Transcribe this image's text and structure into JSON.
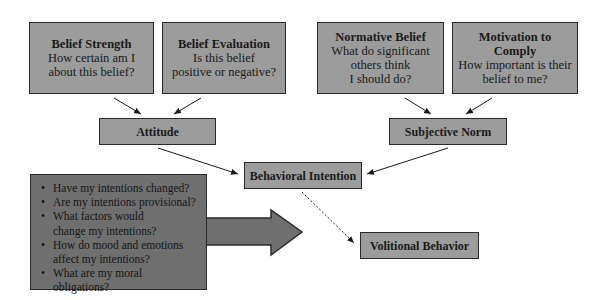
{
  "diagram": {
    "belief_strength": {
      "title": "Belief Strength",
      "lines": [
        "How certain am I",
        "about this belief?"
      ]
    },
    "belief_evaluation": {
      "title": "Belief Evaluation",
      "lines": [
        "Is this belief",
        "positive or negative?"
      ]
    },
    "normative_belief": {
      "title": "Normative Belief",
      "lines": [
        "What do significant",
        "others think",
        "I should do?"
      ]
    },
    "motivation_to_comply": {
      "title_lines": [
        "Motivation to",
        "Comply"
      ],
      "lines": [
        "How important is their",
        "belief to me?"
      ]
    },
    "attitude": "Attitude",
    "subjective_norm": "Subjective Norm",
    "behavioral_intention": "Behavioral Intention",
    "volitional_behavior": "Volitional Behavior",
    "reflection_questions": [
      "Have my intentions changed?",
      "Are my intentions provisional?",
      "What factors would change my intentions?",
      "How do mood and emotions affect my intentions?",
      "What are my moral obligations?"
    ],
    "colors": {
      "box_fill": "#9c9c9c",
      "dark_fill": "#6f6f6f",
      "border": "#2a2a2a"
    }
  }
}
